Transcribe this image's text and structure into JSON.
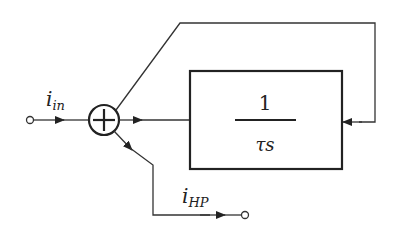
{
  "diagram": {
    "type": "block-diagram",
    "input_label": {
      "main": "i",
      "sub": "in"
    },
    "output_label": {
      "main": "i",
      "sub": "HP"
    },
    "summing_junction": {
      "symbol": "+"
    },
    "block": {
      "numerator": "1",
      "denominator": "τs"
    },
    "colors": {
      "line": "#333333",
      "background": "#ffffff"
    }
  }
}
